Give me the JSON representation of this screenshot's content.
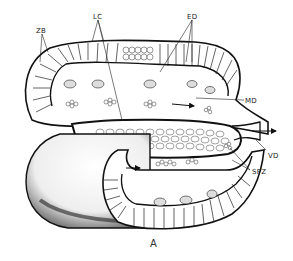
{
  "figure": {
    "title": "A",
    "labels": [
      {
        "id": "ZB",
        "text": "ZB",
        "x": 36,
        "y": 27
      },
      {
        "id": "LC",
        "text": "LC",
        "x": 93,
        "y": 13
      },
      {
        "id": "ED",
        "text": "ED",
        "x": 187,
        "y": 13
      },
      {
        "id": "MD",
        "text": "MD",
        "x": 245,
        "y": 97
      },
      {
        "id": "VD",
        "text": "VD",
        "x": 268,
        "y": 152
      },
      {
        "id": "SPZ",
        "text": "SPZ",
        "x": 252,
        "y": 168
      }
    ]
  },
  "colors": {
    "ink": "#1a1a1a",
    "paper": "#ffffff",
    "shade": "#555555"
  }
}
